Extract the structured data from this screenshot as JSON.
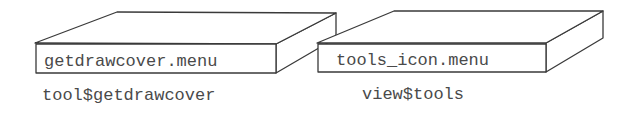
{
  "diagram": {
    "boxes": [
      {
        "label": "getdrawcover.menu",
        "caption": "tool$getdrawcover"
      },
      {
        "label": "tools_icon.menu",
        "caption": "view$tools"
      }
    ],
    "colors": {
      "stroke": "#3a3a3a",
      "text": "#4a4a4a",
      "background": "#ffffff"
    }
  }
}
